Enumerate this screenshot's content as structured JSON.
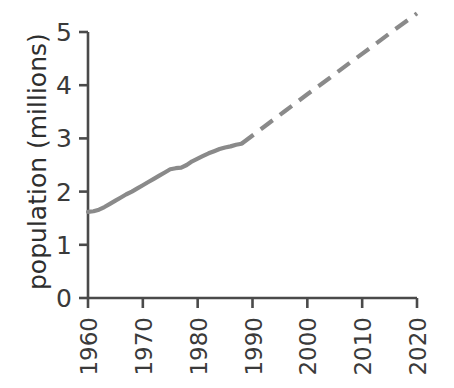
{
  "chart_data": {
    "type": "line",
    "title": "",
    "xlabel": "",
    "ylabel": "population (millions)",
    "xlim": [
      1960,
      2020
    ],
    "ylim": [
      0,
      5
    ],
    "grid": false,
    "legend": "none",
    "x_tick_labels": [
      "1960",
      "1970",
      "1980",
      "1990",
      "2000",
      "2010",
      "2020"
    ],
    "x_ticks": [
      1960,
      1970,
      1980,
      1990,
      2000,
      2010,
      2020
    ],
    "y_tick_labels": [
      "0",
      "1",
      "2",
      "3",
      "4",
      "5"
    ],
    "y_ticks": [
      0,
      1,
      2,
      3,
      4,
      5
    ],
    "series": [
      {
        "name": "observed population",
        "style": "solid",
        "color": "#8a8a8a",
        "x": [
          1960,
          1961,
          1962,
          1963,
          1964,
          1965,
          1966,
          1967,
          1968,
          1969,
          1970,
          1971,
          1972,
          1973,
          1974,
          1975,
          1976,
          1977,
          1978,
          1979,
          1980,
          1981,
          1982,
          1983,
          1984,
          1985,
          1986,
          1987,
          1988
        ],
        "values": [
          1.62,
          1.63,
          1.66,
          1.71,
          1.77,
          1.83,
          1.89,
          1.95,
          2.0,
          2.06,
          2.12,
          2.18,
          2.24,
          2.3,
          2.36,
          2.42,
          2.44,
          2.45,
          2.5,
          2.57,
          2.62,
          2.67,
          2.72,
          2.76,
          2.8,
          2.83,
          2.85,
          2.88,
          2.9
        ]
      },
      {
        "name": "projected population",
        "style": "dashed",
        "color": "#8a8a8a",
        "x": [
          1988,
          1992,
          1996,
          2000,
          2004,
          2008,
          2012,
          2016,
          2020
        ],
        "values": [
          2.9,
          3.21,
          3.52,
          3.83,
          4.13,
          4.44,
          4.74,
          5.05,
          5.35
        ]
      }
    ],
    "axis_color": "#4a4a4a",
    "line_color": "#8a8a8a",
    "background": "#ffffff"
  }
}
